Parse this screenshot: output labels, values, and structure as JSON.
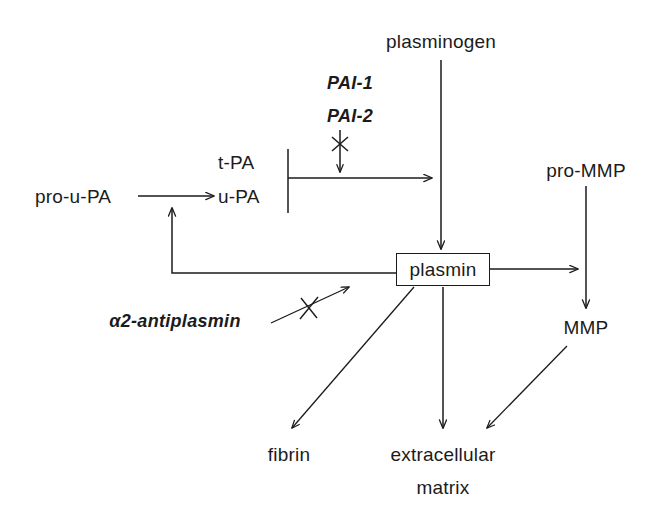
{
  "figure": {
    "kind": "biochemical-pathway-diagram",
    "background_color": "#ffffff",
    "stroke_color": "#1b1b1b"
  },
  "nodes": {
    "plasminogen": {
      "label": "plasminogen",
      "x": 441,
      "y": 42
    },
    "pro_u_pa": {
      "label": "pro-u-PA",
      "x": 82,
      "y": 196
    },
    "u_pa": {
      "label": "u-PA",
      "x": 243,
      "y": 196
    },
    "t_pa": {
      "label": "t-PA",
      "x": 243,
      "y": 162
    },
    "pro_mmp": {
      "label": "pro-MMP",
      "x": 586,
      "y": 170
    },
    "mmp": {
      "label": "MMP",
      "x": 586,
      "y": 327
    },
    "plasmin": {
      "label": "plasmin",
      "x": 443,
      "y": 269,
      "boxed": true
    },
    "fibrin": {
      "label": "fibrin",
      "x": 289,
      "y": 455
    },
    "extracellular_matrix_line1": {
      "label": "extracellular",
      "x": 443,
      "y": 455
    },
    "extracellular_matrix_line2": {
      "label": "matrix",
      "x": 443,
      "y": 487
    }
  },
  "inhibitors": {
    "pai_1": {
      "label": "PAI-1",
      "x": 350,
      "y": 84
    },
    "pai_2": {
      "label": "PAI-2",
      "x": 350,
      "y": 117
    },
    "alpha2_antiplasmin": {
      "label": "α2-antiplasmin",
      "x": 175,
      "y": 322
    }
  },
  "edges": [
    {
      "name": "plasminogen-to-plasmin",
      "type": "activation-arrow",
      "from": "plasminogen",
      "to": "plasmin"
    },
    {
      "name": "pro-u-PA-to-u-PA",
      "type": "conversion-arrow",
      "from": "pro_u_pa",
      "to": "u_pa"
    },
    {
      "name": "pa-bracket-to-plasminogen-activation",
      "type": "activation-arrow",
      "from": "t_pa+u_pa",
      "to": "plasminogen-conversion"
    },
    {
      "name": "plasmin-to-pro-u-PA-feedback",
      "type": "feedback-arrow",
      "from": "plasmin",
      "to": "pro-u-PA-to-u-PA"
    },
    {
      "name": "plasmin-to-pro-MMP",
      "type": "activation-arrow",
      "from": "plasmin",
      "to": "pro-MMP-conversion"
    },
    {
      "name": "pro-MMP-to-MMP",
      "type": "conversion-arrow",
      "from": "pro_mmp",
      "to": "mmp"
    },
    {
      "name": "plasmin-to-fibrin",
      "type": "degradation-arrow",
      "from": "plasmin",
      "to": "fibrin"
    },
    {
      "name": "plasmin-to-extracellular-matrix",
      "type": "degradation-arrow",
      "from": "plasmin",
      "to": "extracellular_matrix"
    },
    {
      "name": "mmp-to-extracellular-matrix",
      "type": "degradation-arrow",
      "from": "mmp",
      "to": "extracellular_matrix"
    },
    {
      "name": "pai-inhibition",
      "type": "inhibition-arrow",
      "from": "pai_1+pai_2",
      "to": "pa-activation-arrow"
    },
    {
      "name": "alpha2-antiplasmin-inhibition",
      "type": "inhibition-arrow",
      "from": "alpha2_antiplasmin",
      "to": "plasmin"
    }
  ]
}
